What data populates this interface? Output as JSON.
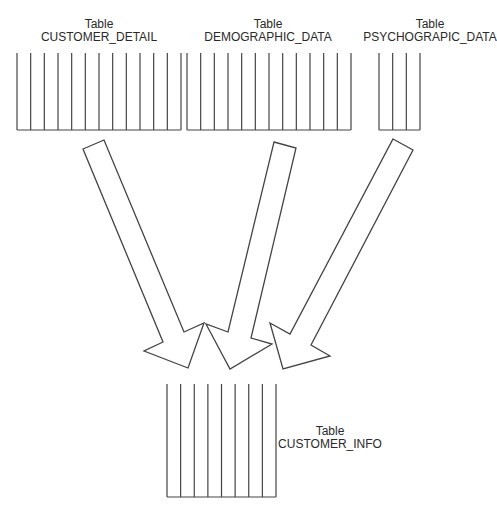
{
  "diagram": {
    "stroke_color": "#444444",
    "background": "#ffffff",
    "source_tables": [
      {
        "id": "customer_detail",
        "kind_label": "Table",
        "name": "CUSTOMER_DETAIL",
        "column_count": 12,
        "x_start": 17,
        "x_end": 181,
        "y_top": 53,
        "y_bottom": 130,
        "label_x": 99,
        "label_y": 18
      },
      {
        "id": "demographic_data",
        "kind_label": "Table",
        "name": "DEMOGRAPHIC_DATA",
        "column_count": 12,
        "x_start": 187,
        "x_end": 351,
        "y_top": 53,
        "y_bottom": 130,
        "label_x": 268,
        "label_y": 18
      },
      {
        "id": "psychograpic_data",
        "kind_label": "Table",
        "name": "PSYCHOGRAPIC_DATA",
        "column_count": 3,
        "x_start": 379,
        "x_end": 420,
        "y_top": 53,
        "y_bottom": 130,
        "label_x": 430,
        "label_y": 18
      }
    ],
    "target_table": {
      "id": "customer_info",
      "kind_label": "Table",
      "name": "CUSTOMER_INFO",
      "column_count": 8,
      "x_start": 167,
      "x_end": 276,
      "y_top": 384,
      "y_bottom": 497,
      "label_x": 330,
      "label_y": 425
    },
    "arrows": [
      {
        "from": "CUSTOMER_DETAIL",
        "to": "CUSTOMER_INFO",
        "points": "83,149 104,140 184,332 204,323 188,368 144,351 163,342"
      },
      {
        "from": "DEMOGRAPHIC_DATA",
        "to": "CUSTOMER_INFO",
        "points": "274,142 296,148 251,338 272,344 230,369 206,324 228,332"
      },
      {
        "from": "PSYCHOGRAPIC_DATA",
        "to": "CUSTOMER_INFO",
        "points": "393,139 413,150 311,345 330,356 283,369 270,323 290,334"
      }
    ]
  }
}
